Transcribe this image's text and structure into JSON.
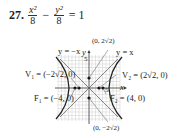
{
  "problem": {
    "number": "27.",
    "term1_num": "x²",
    "term1_den": "8",
    "minus": "−",
    "term2_num": "y²",
    "term2_den": "8",
    "equals": "=",
    "rhs": "1"
  },
  "graph": {
    "asymptote_left_label": "y = −x",
    "asymptote_right_label": "y = x",
    "top_point_label": "(0, 2√2)",
    "bottom_point_label": "(0, −2√2)",
    "v1_label": "V₁ = (−2√2, 0)",
    "v2_label": "V₂ = (2√2, 0)",
    "f1_label": "F₁ = (−4, 0)",
    "f2_label": "F₂ = (4, 0)",
    "x_axis_label": "x",
    "y_axis_label": "y",
    "x_tick": "5",
    "y_tick": "5"
  }
}
